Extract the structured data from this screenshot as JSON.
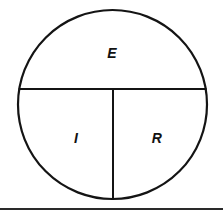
{
  "diagram": {
    "type": "ohms-law-pie-circle",
    "background_color": "#ffffff",
    "stroke_color": "#141414",
    "geometry": {
      "circle_center_x": 112.5,
      "circle_center_y": 104.5,
      "circle_radius": 94.5,
      "horizontal_divider_y": 89,
      "vertical_divider_x": 113
    },
    "segments": [
      {
        "id": "top",
        "symbol": "E",
        "label_x": 112,
        "label_y": 54
      },
      {
        "id": "bottom-left",
        "symbol": "I",
        "label_x": 76,
        "label_y": 139
      },
      {
        "id": "bottom-right",
        "symbol": "R",
        "label_x": 157,
        "label_y": 139
      }
    ],
    "footer_rule": {
      "y": 209,
      "x_start": 0,
      "x_end": 223,
      "color": "#2a2a2a"
    }
  }
}
